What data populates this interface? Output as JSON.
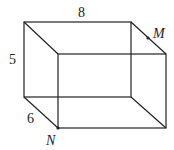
{
  "diagram": {
    "type": "rectangular-prism",
    "labels": {
      "length": "8",
      "height": "5",
      "depth": "6",
      "point_m": "M",
      "point_n": "N"
    },
    "colors": {
      "stroke": "#222222",
      "background": "#ffffff"
    }
  }
}
